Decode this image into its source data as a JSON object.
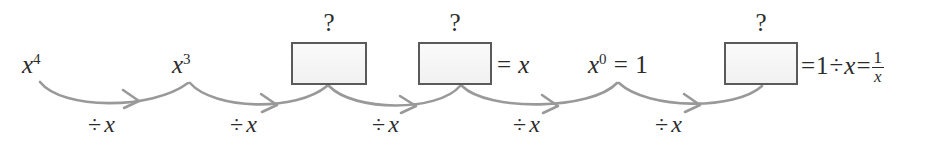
{
  "diagram": {
    "type": "flow-sequence",
    "width": 938,
    "height": 146,
    "background_color": "#ffffff",
    "ink_color": "#2b2b2b",
    "arrow_color": "#999999",
    "box_border_color": "#5a5a5a",
    "box_fill_color": "#f4f4f4"
  },
  "nodes": [
    {
      "id": "node-1",
      "kind": "expression",
      "base": "x",
      "exponent": "4",
      "label": "x^4",
      "x": 22,
      "y": 52
    },
    {
      "id": "node-2",
      "kind": "expression",
      "base": "x",
      "exponent": "3",
      "label": "x^3",
      "x": 172,
      "y": 52
    },
    {
      "id": "node-3",
      "kind": "unknown-box",
      "label": "?",
      "equals": "",
      "x": 291,
      "y": 42,
      "w": 76,
      "h": 43
    },
    {
      "id": "node-4",
      "kind": "unknown-box",
      "label": "?",
      "equals": "= x",
      "x": 418,
      "y": 42,
      "w": 74,
      "h": 43
    },
    {
      "id": "node-5",
      "kind": "expression",
      "base": "x",
      "exponent": "0",
      "label": "x^0 = 1",
      "x": 588,
      "y": 52
    },
    {
      "id": "node-6",
      "kind": "unknown-box",
      "label": "?",
      "equals": "= 1 ÷ x = 1/x",
      "x": 724,
      "y": 42,
      "w": 74,
      "h": 43
    }
  ],
  "box_question_mark": "?",
  "node_equals": {
    "box2_rhs_equals": "=",
    "box2_rhs_value": "x",
    "box3_rhs_equals": "=",
    "box3_rhs_one": "1",
    "box3_rhs_divide": "÷",
    "box3_rhs_var": "x",
    "box3_rhs_equals2": "=",
    "box3_frac_numerator": "1",
    "box3_frac_denominator": "x"
  },
  "node5_text": {
    "base": "x",
    "exponent": "0",
    "equals": "=",
    "value": "1"
  },
  "arrows": [
    {
      "id": "arrow-1",
      "label_divide": "÷",
      "label_var": "x",
      "label_x": 88,
      "label_y": 112
    },
    {
      "id": "arrow-2",
      "label_divide": "÷",
      "label_var": "x",
      "label_x": 230,
      "label_y": 112
    },
    {
      "id": "arrow-3",
      "label_divide": "÷",
      "label_var": "x",
      "label_x": 372,
      "label_y": 112
    },
    {
      "id": "arrow-4",
      "label_divide": "÷",
      "label_var": "x",
      "label_x": 513,
      "label_y": 112
    },
    {
      "id": "arrow-5",
      "label_divide": "÷",
      "label_var": "x",
      "label_x": 655,
      "label_y": 112
    }
  ]
}
